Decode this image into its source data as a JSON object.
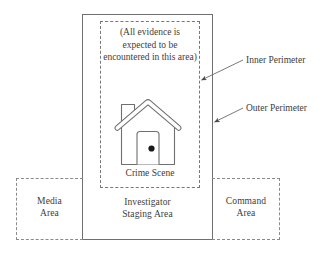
{
  "diagram": {
    "zones": {
      "inner_perimeter": {
        "note": "(All evidence is\nexpected to be\nencountered in\nthis area)",
        "scene_label": "Crime Scene",
        "icon": "house-icon",
        "border_style": "dashed"
      },
      "outer_perimeter": {
        "label": "Investigator\nStaging Area",
        "border_style": "solid"
      },
      "media": {
        "label": "Media\nArea",
        "border_style": "dashed"
      },
      "command": {
        "label": "Command\nArea",
        "border_style": "dashed"
      }
    },
    "callouts": [
      {
        "label": "Inner Perimeter",
        "points_to": "inner-perimeter-box"
      },
      {
        "label": "Outer Perimeter",
        "points_to": "outer-perimeter-box"
      }
    ],
    "colors": {
      "stroke": "#6f6f6f",
      "dashed_stroke": "#8a8a8a",
      "text": "#3d3d3d",
      "background": "#ffffff",
      "doorknob": "#1a1a1a"
    }
  }
}
